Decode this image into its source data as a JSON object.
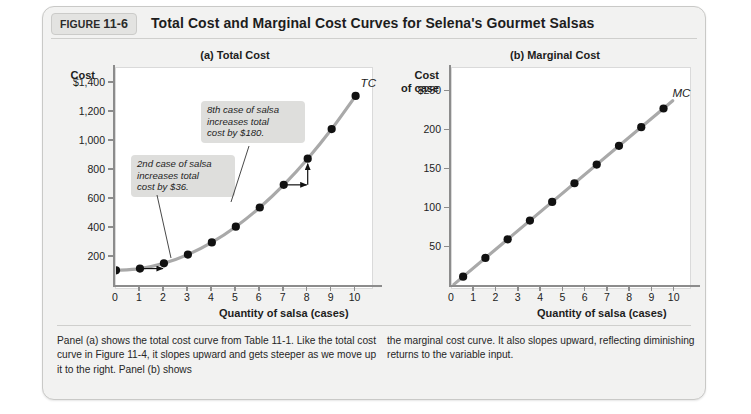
{
  "figure": {
    "tab_prefix": "FIGURE",
    "tab_number": "11-6",
    "title": "Total Cost and Marginal Cost Curves for Selena's Gourmet Salsas"
  },
  "panel_a": {
    "title": "(a) Total Cost",
    "y_caption": "Cost",
    "x_caption": "Quantity of salsa (cases)",
    "curve_label": "TC",
    "callout_1": "2nd case of salsa\nincreases total\ncost by $36.",
    "callout_2": "8th case of salsa\nincreases total\ncost by $180.",
    "y_ticks": [
      "$1,400",
      "1,200",
      "1,000",
      "800",
      "600",
      "400",
      "200"
    ],
    "x_ticks": [
      "0",
      "1",
      "2",
      "3",
      "4",
      "5",
      "6",
      "7",
      "8",
      "9",
      "10"
    ]
  },
  "panel_b": {
    "title": "(b) Marginal Cost",
    "y_caption": "Cost\nof case",
    "x_caption": "Quantity of salsa (cases)",
    "curve_label": "MC",
    "y_ticks": [
      "$250",
      "200",
      "150",
      "100",
      "50"
    ],
    "x_ticks": [
      "0",
      "1",
      "2",
      "3",
      "4",
      "5",
      "6",
      "7",
      "8",
      "9",
      "10"
    ]
  },
  "caption": {
    "left": "Panel (a) shows the total cost curve from Table 11-1. Like the total cost curve in Figure 11-4, it slopes upward and gets steeper as we move up it to the right. Panel (b) shows",
    "right": "the marginal cost curve. It also slopes upward, reflecting diminishing returns to the variable input."
  },
  "colors": {
    "card_background": "#f2f2f1",
    "plot_background": "#ffffff",
    "curve": "#a9a9a9",
    "point": "#111111",
    "callout_background": "#dededc",
    "axis": "#8c8c8c"
  },
  "chart_data": [
    {
      "type": "line",
      "title": "(a) Total Cost",
      "xlabel": "Quantity of salsa (cases)",
      "ylabel": "Cost",
      "series_name": "TC",
      "x": [
        0,
        1,
        2,
        3,
        4,
        5,
        6,
        7,
        8,
        9,
        10
      ],
      "values": [
        108,
        120,
        156,
        216,
        300,
        408,
        540,
        696,
        876,
        1080,
        1308
      ],
      "xlim": [
        0,
        10.6
      ],
      "ylim": [
        0,
        1500
      ],
      "ytick_values": [
        200,
        400,
        600,
        800,
        1000,
        1200,
        1400
      ],
      "xtick_values": [
        0,
        1,
        2,
        3,
        4,
        5,
        6,
        7,
        8,
        9,
        10
      ],
      "grid": false,
      "legend": "inline-curve-label",
      "annotations": [
        {
          "text": "2nd case of salsa increases total cost by $36.",
          "points_to_x": 2,
          "points_to_y": 156
        },
        {
          "text": "8th case of salsa increases total cost by $180.",
          "points_to_x": 8,
          "points_to_y": 876
        }
      ]
    },
    {
      "type": "line",
      "title": "(b) Marginal Cost",
      "xlabel": "Quantity of salsa (cases)",
      "ylabel": "Cost of case",
      "series_name": "MC",
      "x": [
        0.5,
        1.5,
        2.5,
        3.5,
        4.5,
        5.5,
        6.5,
        7.5,
        8.5,
        9.5
      ],
      "values": [
        12,
        36,
        60,
        84,
        108,
        132,
        156,
        180,
        204,
        228
      ],
      "xlim": [
        0,
        10.6
      ],
      "ylim": [
        0,
        280
      ],
      "ytick_values": [
        50,
        100,
        150,
        200,
        250
      ],
      "xtick_values": [
        0,
        1,
        2,
        3,
        4,
        5,
        6,
        7,
        8,
        9,
        10
      ],
      "grid": false,
      "legend": "inline-curve-label"
    }
  ]
}
